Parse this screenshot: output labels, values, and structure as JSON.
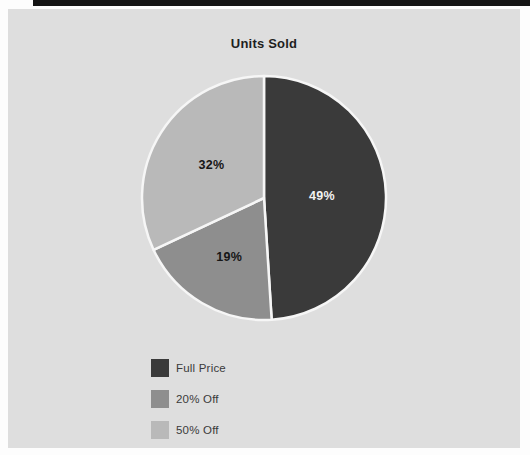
{
  "page": {
    "title": "Units Sold"
  },
  "colors": {
    "page_bg": "#fdfdfd",
    "panel_bg": "#dedede",
    "scan_edge_bar": "#141414",
    "slice_separator": "#f6f6f6",
    "title_text": "#1f1f1f",
    "legend_text": "#3a3a3a"
  },
  "chart_data": {
    "type": "pie",
    "title": "Units Sold",
    "values_shown_as": "percent",
    "start_angle_deg": 0,
    "direction": "clockwise",
    "legend_position": "bottom-left",
    "slices": [
      {
        "label": "Full Price",
        "value": 49,
        "display": "49%",
        "color": "#3a3a3a",
        "text_color": "#f2f2f2"
      },
      {
        "label": "20% Off",
        "value": 19,
        "display": "19%",
        "color": "#8e8e8e",
        "text_color": "#161616"
      },
      {
        "label": "50% Off",
        "value": 32,
        "display": "32%",
        "color": "#b9b9b9",
        "text_color": "#161616"
      }
    ]
  }
}
